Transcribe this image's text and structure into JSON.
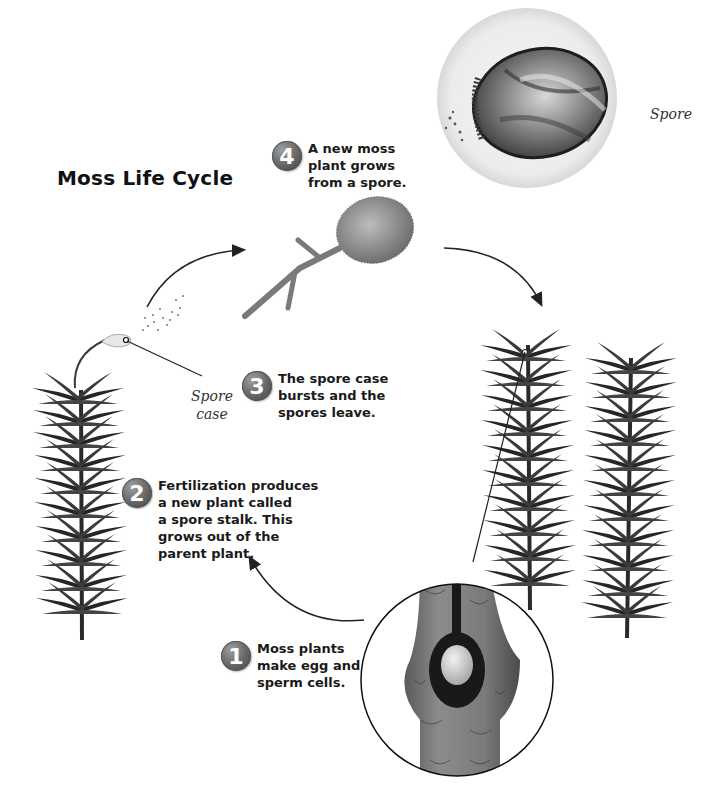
{
  "title": "Moss Life Cycle",
  "steps": [
    {
      "number": "1",
      "text": "Moss plants\nmake egg and\nsperm cells."
    },
    {
      "number": "2",
      "text": "Fertilization produces\na new plant called\na spore stalk. This\ngrows out of the\nparent plant."
    },
    {
      "number": "3",
      "text": "The spore case\nbursts and the\nspores leave."
    },
    {
      "number": "4",
      "text": "A new moss\nplant grows\nfrom a spore."
    }
  ],
  "labels": {
    "spore": "Spore",
    "spore_case": "Spore\ncase"
  },
  "colors": {
    "badge": "#6e6e6e",
    "text": "#1a1a1a",
    "plant": "#2a2a2a",
    "arrow": "#222222"
  }
}
